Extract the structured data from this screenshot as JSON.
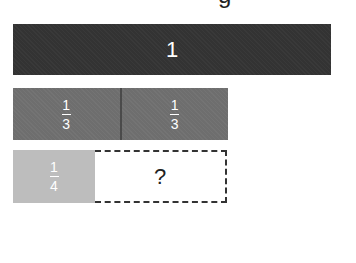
{
  "header": {
    "cut_text": "g"
  },
  "diagram": {
    "whole": {
      "label": "1",
      "color": "#333333"
    },
    "thirds": [
      {
        "numerator": "1",
        "denominator": "3"
      },
      {
        "numerator": "1",
        "denominator": "3"
      }
    ],
    "thirds_color": "#6e6e6e",
    "quarter": {
      "numerator": "1",
      "denominator": "4",
      "color": "#bdbdbd"
    },
    "unknown": {
      "label": "?"
    }
  }
}
